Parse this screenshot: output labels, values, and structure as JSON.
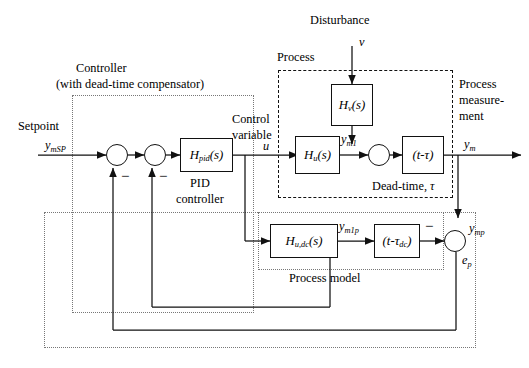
{
  "diagram": {
    "groups": {
      "controller": {
        "label_line1": "Controller",
        "label_line2": "(with dead-time compensator)",
        "border_style": "dotted"
      },
      "process": {
        "label": "Process",
        "border_style": "dashed"
      },
      "process_model": {
        "label": "Process model",
        "border_style": "dotted"
      }
    },
    "signals": {
      "setpoint_text": "Setpoint",
      "setpoint_var": "y",
      "setpoint_var_sub": "mSP",
      "control_text_line1": "Control",
      "control_text_line2": "variable",
      "control_var": "u",
      "disturbance_text": "Disturbance",
      "disturbance_var": "v",
      "measurement_line1": "Process",
      "measurement_line2": "measure-",
      "measurement_line3": "ment",
      "measurement_var": "y",
      "measurement_var_sub": "m",
      "ym1_var": "y",
      "ym1_sub": "m1",
      "ym1p_var": "y",
      "ym1p_sub": "m1p",
      "ymp_var": "y",
      "ymp_sub": "mp",
      "ep_var": "e",
      "ep_sub": "p",
      "minus_sign": "−"
    },
    "blocks": [
      {
        "id": "pid",
        "name": "H",
        "sub": "pid",
        "arg": "(s)",
        "caption_line1": "PID",
        "caption_line2": "controller"
      },
      {
        "id": "hv",
        "name": "H",
        "sub": "v",
        "arg": "(s)",
        "caption_line1": "",
        "caption_line2": ""
      },
      {
        "id": "hu",
        "name": "H",
        "sub": "u",
        "arg": "(s)",
        "caption_line1": "",
        "caption_line2": ""
      },
      {
        "id": "deadtime",
        "name": "(t-",
        "sub": "",
        "arg": "τ)",
        "caption_line1": "Dead-time, τ",
        "caption_line2": ""
      },
      {
        "id": "hudc",
        "name": "H",
        "sub": "u,dc",
        "arg": "(s)",
        "caption_line1": "",
        "caption_line2": ""
      },
      {
        "id": "deadtime_model",
        "name": "(t-",
        "sub": "dc",
        "arg": "τ",
        "caption_line1": "",
        "caption_line2": ""
      }
    ],
    "block_labels": {
      "pid": "Hₚᵢₔ(s)",
      "hv": "Hᵥ(s)",
      "hu": "Hᵤ(s)",
      "deadtime": "(t-τ)",
      "hudc": "Hᵤ,dc(s)",
      "deadtime_model": "(t-τdc)"
    },
    "colors": {
      "line": "#111111",
      "background": "#ffffff",
      "group_dashed": "#111111",
      "group_dotted": "#555555"
    }
  }
}
